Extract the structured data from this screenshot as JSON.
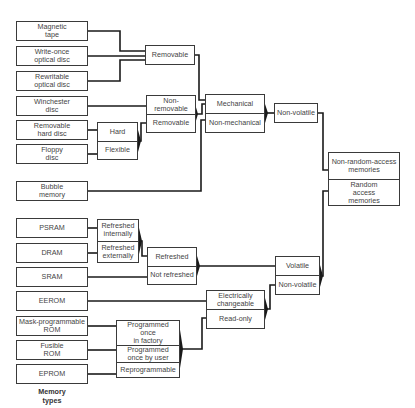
{
  "diagram": {
    "caption": "Memory\ntypes",
    "memory_types": [
      {
        "id": "magnetic_tape",
        "label": "Magnetic\ntape"
      },
      {
        "id": "write_once",
        "label": "Write-once\noptical disc"
      },
      {
        "id": "rewritable",
        "label": "Rewritable\noptical disc"
      },
      {
        "id": "winchester",
        "label": "Winchester\ndisc"
      },
      {
        "id": "removable_hard",
        "label": "Removable\nhard disc"
      },
      {
        "id": "floppy",
        "label": "Floppy\ndisc"
      },
      {
        "id": "bubble",
        "label": "Bubble\nmemory"
      },
      {
        "id": "psram",
        "label": "PSRAM"
      },
      {
        "id": "dram",
        "label": "DRAM"
      },
      {
        "id": "sram",
        "label": "SRAM"
      },
      {
        "id": "eerom",
        "label": "EEROM"
      },
      {
        "id": "mask_rom",
        "label": "Mask-programmable\nROM"
      },
      {
        "id": "fusible_rom",
        "label": "Fusible\nROM"
      },
      {
        "id": "eprom",
        "label": "EPROM"
      }
    ],
    "categories": {
      "removable_optical": [
        "Removable"
      ],
      "disc_removability": [
        "Non-\nremovable",
        "Removable"
      ],
      "hard_flexible": [
        "Hard",
        "Flexible"
      ],
      "mechanical": [
        "Mechanical",
        "Non-mechanical"
      ],
      "non_volatile_top": [
        "Non-volatile"
      ],
      "access": [
        "Non-random-access\nmemories",
        "Random\naccess\nmemories"
      ],
      "refresh_source": [
        "Refreshed\ninternally",
        "Refreshed\nexternally"
      ],
      "refresh": [
        "Refreshed",
        "Not refreshed"
      ],
      "volatility": [
        "Volatile",
        "Non-volatile"
      ],
      "changeability": [
        "Electrically\nchangeable",
        "Read-only"
      ],
      "programming": [
        "Programmed once\nin factory",
        "Programmed\nonce by user",
        "Reprogrammable"
      ]
    },
    "line_color": "#1a1a1a",
    "border_color": "#3a3a3a"
  }
}
